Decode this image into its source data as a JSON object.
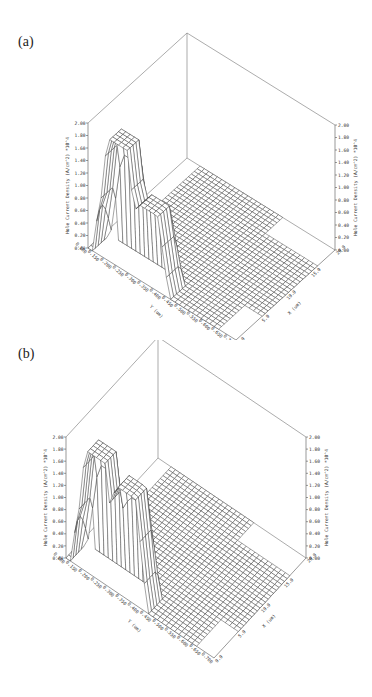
{
  "figure": {
    "panels": [
      {
        "id": "a",
        "label": "(a)"
      },
      {
        "id": "b",
        "label": "(b)"
      }
    ]
  },
  "axes": {
    "z_label": "Hole Current Density (A/cm^2) *10^4",
    "z_ticks": [
      "0.00",
      "0.20",
      "0.40",
      "0.60",
      "0.80",
      "1.00",
      "1.20",
      "1.40",
      "1.60",
      "1.80",
      "2.00"
    ],
    "y_label": "Y (um)",
    "y_ticks": [
      "0.100",
      "0.150",
      "0.200",
      "0.250",
      "0.300",
      "0.350",
      "0.400",
      "0.450",
      "0.500",
      "0.550",
      "0.600",
      "0.650",
      "0.700"
    ],
    "x_label": "X (um)",
    "x_ticks": [
      "0.0",
      "5.0",
      "10.0",
      "15.0",
      "20.0"
    ]
  },
  "chart_data": [
    {
      "type": "surface",
      "panel": "(a)",
      "title": "",
      "xlabel": "X (um)",
      "ylabel": "Y (um)",
      "zlabel": "Hole Current Density (A/cm^2) *10^4",
      "x_range": [
        0.0,
        20.0
      ],
      "y_range": [
        0.1,
        0.7
      ],
      "z_range": [
        0.0,
        2.0
      ],
      "x_ticks": [
        0.0,
        5.0,
        10.0,
        15.0,
        20.0
      ],
      "y_ticks": [
        0.1,
        0.15,
        0.2,
        0.25,
        0.3,
        0.35,
        0.4,
        0.45,
        0.5,
        0.55,
        0.6,
        0.65,
        0.7
      ],
      "z_ticks": [
        0.0,
        0.2,
        0.4,
        0.6,
        0.8,
        1.0,
        1.2,
        1.4,
        1.6,
        1.8,
        2.0
      ],
      "grid": false,
      "features": [
        {
          "name": "peak-1",
          "approx_max": 1.2,
          "location": "near y=0.35, x=0-3 um"
        },
        {
          "name": "peak-2",
          "approx_max": 1.95,
          "location": "near y=0.25, x=0-3 um"
        },
        {
          "name": "floor",
          "approx_value": 0.0,
          "location": "rest of domain"
        }
      ]
    },
    {
      "type": "surface",
      "panel": "(b)",
      "title": "",
      "xlabel": "X (um)",
      "ylabel": "Y (um)",
      "zlabel": "Hole Current Density (A/cm^2) *10^4",
      "x_range": [
        0.0,
        20.0
      ],
      "y_range": [
        0.1,
        0.7
      ],
      "z_range": [
        0.0,
        2.0
      ],
      "x_ticks": [
        0.0,
        5.0,
        10.0,
        15.0,
        20.0
      ],
      "y_ticks": [
        0.1,
        0.15,
        0.2,
        0.25,
        0.3,
        0.35,
        0.4,
        0.45,
        0.5,
        0.55,
        0.6,
        0.65,
        0.7
      ],
      "z_ticks": [
        0.0,
        0.2,
        0.4,
        0.6,
        0.8,
        1.0,
        1.2,
        1.4,
        1.6,
        1.8,
        2.0
      ],
      "grid": false,
      "features": [
        {
          "name": "peak-1",
          "approx_max": 1.75,
          "location": "near y=0.35, x=0-3 um"
        },
        {
          "name": "peak-2",
          "approx_max": 2.0,
          "location": "near y=0.25, x=0-3 um"
        },
        {
          "name": "floor",
          "approx_value": 0.0,
          "location": "rest of domain"
        }
      ]
    }
  ]
}
